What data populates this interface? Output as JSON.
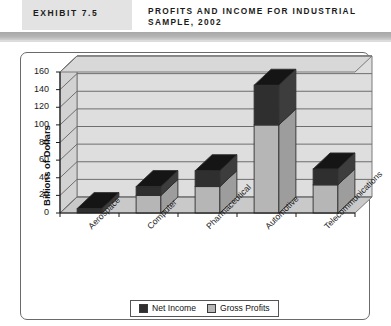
{
  "header": {
    "exhibit_label": "EXHIBIT 7.5",
    "title": "PROFITS AND INCOME FOR INDUSTRIAL SAMPLE, 2002"
  },
  "legend": {
    "items": [
      {
        "label": "Net Income",
        "color": "#2f2f2f"
      },
      {
        "label": "Gross Profits",
        "color": "#b6b6b6"
      }
    ]
  },
  "chart_data": {
    "type": "bar",
    "subtype": "stacked-3d-column",
    "title": "PROFITS AND INCOME FOR INDUSTRIAL SAMPLE, 2002",
    "xlabel": "",
    "ylabel": "Billions of Dollars",
    "ylim": [
      0,
      160
    ],
    "ytick_step": 20,
    "yticks": [
      0,
      20,
      40,
      60,
      80,
      100,
      120,
      140,
      160
    ],
    "grid": true,
    "legend_position": "bottom",
    "categories": [
      "Aerospace",
      "Computer",
      "Pharmaceutical",
      "Automotive",
      "Telecommunications"
    ],
    "series": [
      {
        "name": "Gross Profits",
        "color": "#b6b6b6",
        "values": [
          0,
          20,
          30,
          100,
          32
        ]
      },
      {
        "name": "Net Income",
        "color": "#2f2f2f",
        "values": [
          5,
          10,
          18,
          45,
          18
        ]
      }
    ],
    "totals": [
      5,
      30,
      48,
      145,
      50
    ]
  }
}
